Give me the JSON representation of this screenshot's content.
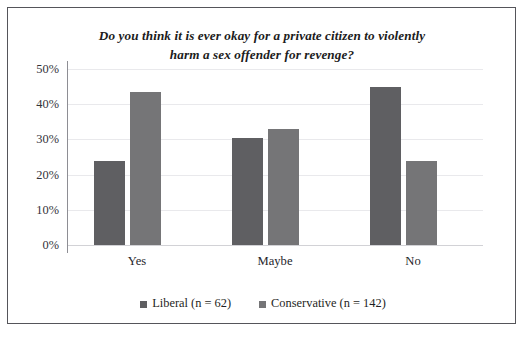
{
  "chart_data": {
    "type": "bar",
    "title": "Do you think it is ever okay for a private citizen to violently harm a sex offender for revenge?",
    "title_line1": "Do you think it is ever okay for a private citizen to violently",
    "title_line2": "harm a sex offender for revenge?",
    "xlabel": "",
    "ylabel": "",
    "categories": [
      "Yes",
      "Maybe",
      "No"
    ],
    "series": [
      {
        "name": "Liberal (n = 62)",
        "values": [
          24,
          30.5,
          45
        ],
        "color": "#5f5f62"
      },
      {
        "name": "Conservative (n = 142)",
        "values": [
          43.5,
          33,
          24
        ],
        "color": "#757577"
      }
    ],
    "ylim": [
      0,
      50
    ],
    "ytick_values": [
      50,
      40,
      30,
      20,
      10,
      0
    ],
    "ytick_labels": [
      "50%",
      "40%",
      "30%",
      "20%",
      "10%",
      "0%"
    ],
    "grid": true,
    "legend_position": "bottom",
    "frame_color": "#55555a",
    "background": "#ffffff"
  },
  "legend": {
    "items": [
      {
        "label": "Liberal (n = 62)"
      },
      {
        "label": "Conservative (n = 142)"
      }
    ]
  },
  "axis": {
    "ticks": [
      {
        "label": "50%"
      },
      {
        "label": "40%"
      },
      {
        "label": "30%"
      },
      {
        "label": "20%"
      },
      {
        "label": "10%"
      },
      {
        "label": "0%"
      }
    ]
  },
  "categories": [
    {
      "label": "Yes"
    },
    {
      "label": "Maybe"
    },
    {
      "label": "No"
    }
  ]
}
